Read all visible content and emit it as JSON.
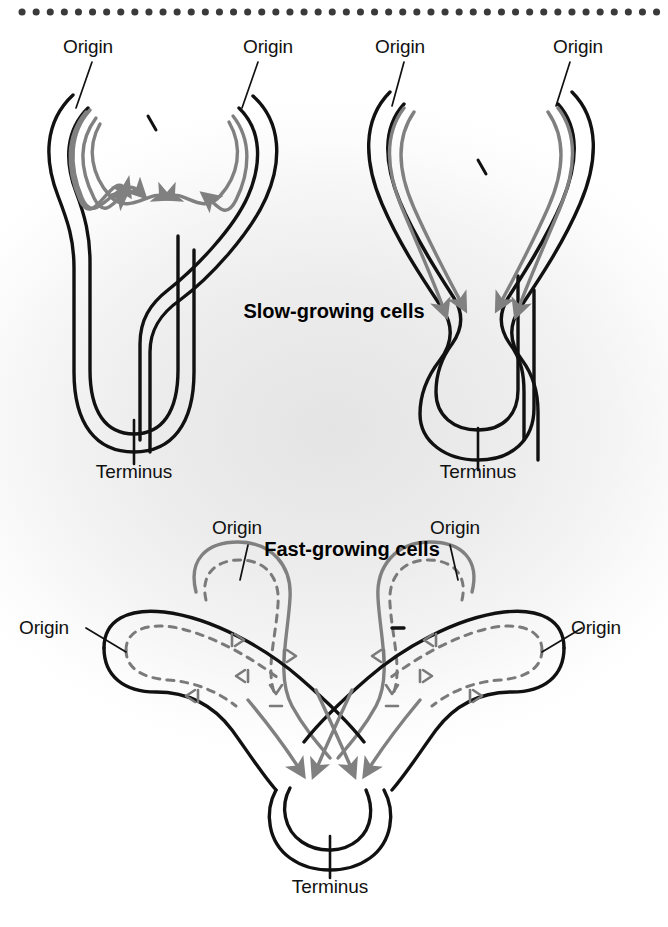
{
  "figure": {
    "title_top": "Slow-growing cells",
    "title_bottom": "Fast-growing cells",
    "border": {
      "style": "dotted",
      "color": "#3a3a3a",
      "position": "top"
    },
    "colors": {
      "strand_parent": "#111111",
      "strand_daughter": "#808080",
      "dashed_replicating": "#7a7a7a",
      "background_center": "#e4e4e4",
      "background_edge": "#ffffff",
      "label_text": "#111111"
    }
  },
  "panels": [
    {
      "id": "slow-left",
      "group": "slow-growing",
      "labels": [
        {
          "name": "origin-label",
          "text": "Origin",
          "x": 88,
          "y": 47
        },
        {
          "name": "origin-label",
          "text": "Origin",
          "x": 268,
          "y": 47
        },
        {
          "name": "terminus-label",
          "text": "Terminus",
          "x": 155,
          "y": 447
        }
      ],
      "replication_forks": 2,
      "arrow_count": 4,
      "description": "Theta-replicating chromosome, two forks advanced a short distance from origin"
    },
    {
      "id": "slow-right",
      "group": "slow-growing",
      "labels": [
        {
          "name": "origin-label",
          "text": "Origin",
          "x": 400,
          "y": 47
        },
        {
          "name": "origin-label",
          "text": "Origin",
          "x": 578,
          "y": 47
        },
        {
          "name": "terminus-label",
          "text": "Terminus",
          "x": 485,
          "y": 447
        }
      ],
      "replication_forks": 2,
      "arrow_count": 4,
      "description": "Theta-replicating chromosome, forks advanced further toward terminus"
    },
    {
      "id": "fast",
      "group": "fast-growing",
      "labels": [
        {
          "name": "origin-label",
          "text": "Origin",
          "x": 237,
          "y": 528
        },
        {
          "name": "origin-label",
          "text": "Origin",
          "x": 455,
          "y": 528
        },
        {
          "name": "origin-label",
          "text": "Origin",
          "x": 42,
          "y": 626
        },
        {
          "name": "origin-label",
          "text": "Origin",
          "x": 566,
          "y": 626
        },
        {
          "name": "terminus-label",
          "text": "Terminus",
          "x": 290,
          "y": 884
        }
      ],
      "replication_forks": 6,
      "arrow_count": 4,
      "description": "Multifork replication: nested dashed daughter loops with new origins fired before previous round completes"
    }
  ],
  "legend_semantics": {
    "solid_black": "Parental / completed DNA strand",
    "solid_gray": "Newly replicated daughter strand",
    "dashed_gray": "Second-round (nested) replication in progress",
    "arrowhead": "Direction of replication fork movement",
    "tick_mark": "Origin / terminus position marker"
  }
}
